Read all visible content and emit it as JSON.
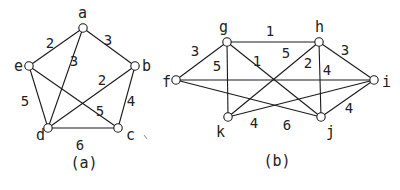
{
  "colors": {
    "ink": "#1a1a1a",
    "background": "#ffffff"
  },
  "graphs": [
    {
      "caption": "(a)",
      "caption_pos": [
        84,
        168
      ],
      "nodes": [
        {
          "id": "a",
          "x": 83,
          "y": 28,
          "lx": 78,
          "ly": 18
        },
        {
          "id": "b",
          "x": 135,
          "y": 66,
          "lx": 142,
          "ly": 71
        },
        {
          "id": "c",
          "x": 118,
          "y": 128,
          "lx": 126,
          "ly": 140
        },
        {
          "id": "d",
          "x": 48,
          "y": 128,
          "lx": 36,
          "ly": 140
        },
        {
          "id": "e",
          "x": 29,
          "y": 66,
          "lx": 14,
          "ly": 71
        }
      ],
      "edges": [
        {
          "from": "a",
          "to": "e",
          "weight": "2",
          "wx": 50,
          "wy": 48
        },
        {
          "from": "a",
          "to": "b",
          "weight": "3",
          "wx": 108,
          "wy": 45
        },
        {
          "from": "a",
          "to": "d",
          "weight": "3",
          "wx": 74,
          "wy": 66
        },
        {
          "from": "b",
          "to": "d",
          "weight": "2",
          "wx": 102,
          "wy": 85
        },
        {
          "from": "b",
          "to": "c",
          "weight": "4",
          "wx": 131,
          "wy": 106
        },
        {
          "from": "e",
          "to": "d",
          "weight": "5",
          "wx": 25,
          "wy": 106
        },
        {
          "from": "e",
          "to": "c",
          "weight": "5",
          "wx": 100,
          "wy": 116
        },
        {
          "from": "d",
          "to": "c",
          "weight": "6",
          "wx": 80,
          "wy": 150
        }
      ]
    },
    {
      "caption": "(b)",
      "caption_pos": [
        277,
        166
      ],
      "nodes": [
        {
          "id": "f",
          "x": 176,
          "y": 80,
          "lx": 162,
          "ly": 87
        },
        {
          "id": "g",
          "x": 227,
          "y": 42,
          "lx": 219,
          "ly": 32
        },
        {
          "id": "h",
          "x": 319,
          "y": 42,
          "lx": 315,
          "ly": 32
        },
        {
          "id": "i",
          "x": 374,
          "y": 80,
          "lx": 382,
          "ly": 87
        },
        {
          "id": "k",
          "x": 228,
          "y": 117,
          "lx": 216,
          "ly": 137
        },
        {
          "id": "j",
          "x": 321,
          "y": 117,
          "lx": 326,
          "ly": 137
        }
      ],
      "edges": [
        {
          "from": "f",
          "to": "g",
          "weight": "3",
          "wx": 195,
          "wy": 56
        },
        {
          "from": "g",
          "to": "h",
          "weight": "1",
          "wx": 270,
          "wy": 36
        },
        {
          "from": "g",
          "to": "k",
          "weight": "5",
          "wx": 217,
          "wy": 71
        },
        {
          "from": "g",
          "to": "j",
          "weight": "1",
          "wx": 257,
          "wy": 66
        },
        {
          "from": "k",
          "to": "h",
          "weight": "5",
          "wx": 286,
          "wy": 58
        },
        {
          "from": "h",
          "to": "j",
          "weight": "2",
          "wx": 308,
          "wy": 68
        },
        {
          "from": "h",
          "to": "i",
          "weight": "3",
          "wx": 345,
          "wy": 55
        },
        {
          "from": "f",
          "to": "i",
          "weight": "4",
          "wx": 327,
          "wy": 75
        },
        {
          "from": "k",
          "to": "i",
          "weight": "4",
          "wx": 254,
          "wy": 128
        },
        {
          "from": "f",
          "to": "j",
          "weight": "6",
          "wx": 287,
          "wy": 130
        },
        {
          "from": "j",
          "to": "i",
          "weight": "4",
          "wx": 349,
          "wy": 113
        }
      ]
    }
  ]
}
